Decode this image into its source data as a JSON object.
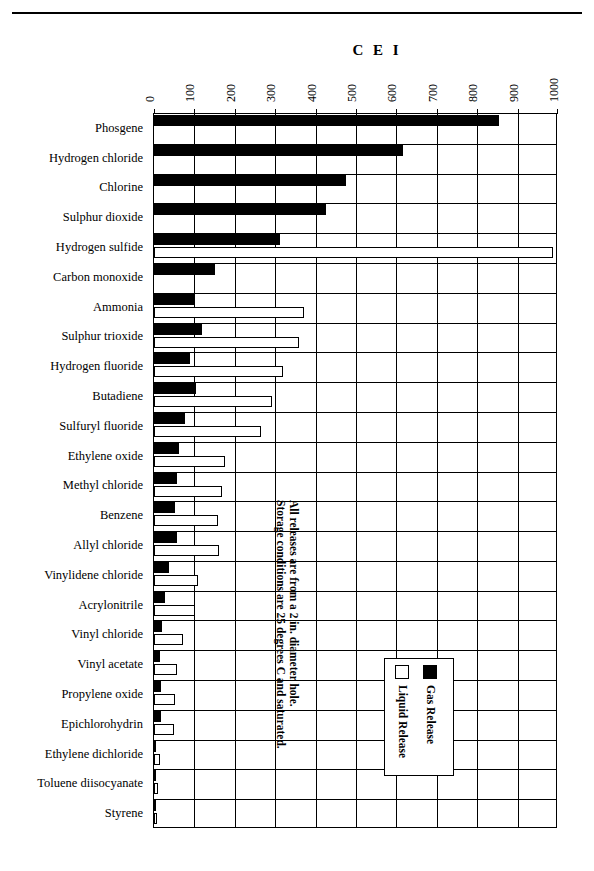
{
  "title": "C E I",
  "top_rule": true,
  "annotation": {
    "line1": "All releases are from a 2 in. diameter hole.",
    "line2": "Storage conditions are 25 degrees C and saturated."
  },
  "legend": {
    "entries": [
      {
        "label": "Gas Release",
        "swatch": "filled",
        "color": "#000000"
      },
      {
        "label": "Liquid Release",
        "swatch": "open",
        "color": "#ffffff"
      }
    ]
  },
  "chart_data": {
    "type": "bar",
    "orientation": "horizontal",
    "title": "C E I",
    "xlabel": "CEI",
    "ylabel": "",
    "xlim": [
      0,
      1000
    ],
    "xticks": [
      0,
      100,
      200,
      300,
      400,
      500,
      600,
      700,
      800,
      900,
      1000
    ],
    "xtick_labels": [
      "0",
      "100",
      "200",
      "300",
      "400",
      "500",
      "600",
      "700",
      "800",
      "900",
      "1000"
    ],
    "grid": true,
    "legend_position": "inside-lower-right",
    "categories": [
      "Phosgene",
      "Hydrogen chloride",
      "Chlorine",
      "Sulphur dioxide",
      "Hydrogen sulfide",
      "Carbon monoxide",
      "Ammonia",
      "Sulphur trioxide",
      "Hydrogen fluoride",
      "Butadiene",
      "Sulfuryl fluoride",
      "Ethylene oxide",
      "Methyl chloride",
      "Benzene",
      "Allyl chloride",
      "Vinylidene chloride",
      "Acrylonitrile",
      "Vinyl chloride",
      "Vinyl acetate",
      "Propylene oxide",
      "Epichlorohydrin",
      "Ethylene dichloride",
      "Toluene diisocyanate",
      "Styrene"
    ],
    "series": [
      {
        "name": "Gas Release",
        "color": "#000000",
        "values": [
          854,
          616,
          475,
          425,
          312,
          152,
          100,
          118,
          90,
          103,
          76,
          62,
          58,
          52,
          57,
          38,
          26,
          20,
          14,
          18,
          18,
          6,
          4,
          3
        ]
      },
      {
        "name": "Liquid Release",
        "color": "#ffffff",
        "values": [
          0,
          0,
          0,
          0,
          988,
          0,
          372,
          360,
          320,
          293,
          266,
          175,
          168,
          158,
          160,
          110,
          102,
          72,
          56,
          52,
          50,
          16,
          10,
          8
        ]
      }
    ]
  }
}
